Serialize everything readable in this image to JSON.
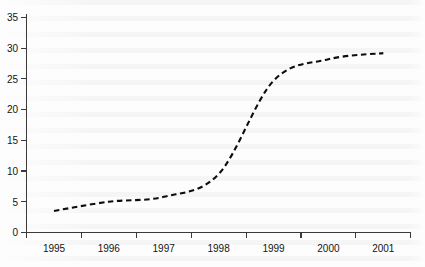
{
  "chart_data": {
    "type": "line",
    "title": "",
    "subtitle": "",
    "xlabel": "",
    "ylabel": "",
    "categories": [
      "1995",
      "1996",
      "1997",
      "1998",
      "1999",
      "2000",
      "2001"
    ],
    "series": [
      {
        "name": "",
        "values": [
          3.5,
          5.0,
          5.8,
          9.5,
          24.7,
          28.2,
          29.2
        ]
      }
    ],
    "xlim": [
      1995,
      2001
    ],
    "ylim": [
      0,
      35
    ],
    "yticks": [
      0,
      5,
      10,
      15,
      20,
      25,
      30,
      35
    ],
    "ytick_labels": [
      "0",
      "5",
      "10",
      "15",
      "20",
      "25",
      "30",
      "35"
    ],
    "xtick_labels": [
      "1995",
      "1996",
      "1997",
      "1998",
      "1999",
      "2000",
      "2001"
    ],
    "grid": false,
    "legend": false,
    "legend_position": "none",
    "line_style": "dashed",
    "line_color": "#0d0d0d",
    "axis_color": "#3a3a3a",
    "background_color": "#fdfdfd",
    "annotations": []
  },
  "figure": {
    "background_note": "faint scanned-page text bleed-through behind plot"
  }
}
